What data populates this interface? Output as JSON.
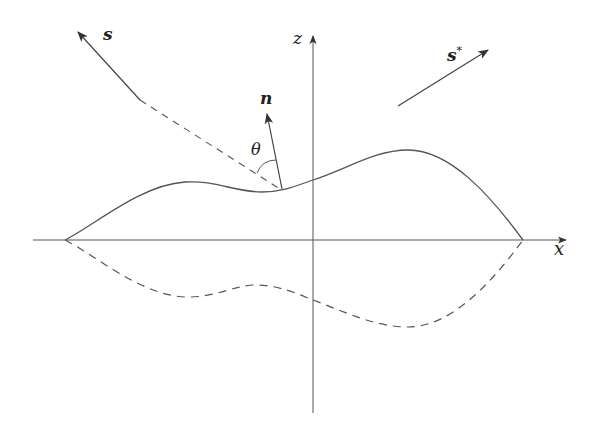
{
  "diagram": {
    "type": "surface-scattering-geometry",
    "labels": {
      "incident": "s",
      "scattered": "s",
      "scattered_sup": "*",
      "normal": "n",
      "angle": "θ",
      "z_axis": "z",
      "x_axis": "x"
    },
    "elements": [
      "x-axis with arrow",
      "z-axis with arrow",
      "solid rough surface profile above x-axis",
      "dashed mirrored surface profile below x-axis",
      "incident direction s (arrow, dashed toward surface)",
      "scattered direction s* (arrow)",
      "surface normal n at point on surface",
      "angle θ between s and n"
    ],
    "colors": {
      "stroke": "#444444",
      "text": "#222222",
      "background": "#ffffff"
    }
  }
}
